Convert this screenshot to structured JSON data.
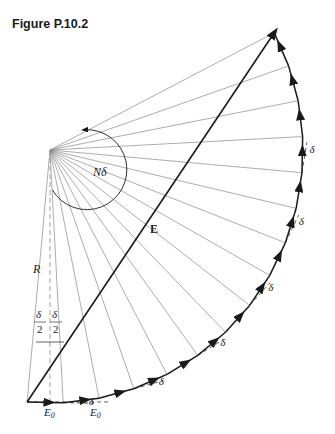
{
  "title": "Figure P.10.2",
  "labels": {
    "resultant": "E",
    "radius": "R",
    "sweep": "Nδ",
    "phasor": "E",
    "phasor_sub": "0",
    "half_num": "δ",
    "half_den": "2",
    "angle": "δ"
  },
  "geometry": {
    "center": [
      50,
      150
    ],
    "radius": 253,
    "start_angle_deg": 95.2,
    "end_angle_deg": -27.6,
    "segments": 15,
    "delta_labels_at": [
      1,
      3,
      5,
      7,
      9,
      11
    ]
  },
  "colors": {
    "ink": "#1a1a1a",
    "thin": "#8a8a8a",
    "bg": "#ffffff"
  }
}
